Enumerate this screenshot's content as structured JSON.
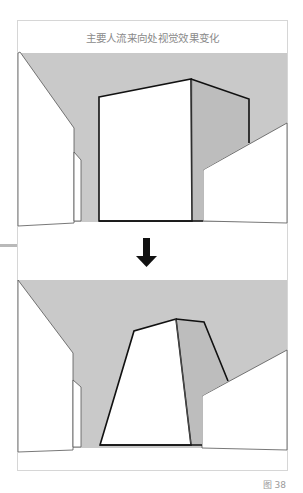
{
  "figure": {
    "title": "主要人流来向处视觉效果变化",
    "caption": "图 38",
    "colors": {
      "ceiling_gray": "#c9c9c9",
      "side_face_gray": "#bdbdbd",
      "outline": "#111111",
      "thin_line": "#555555",
      "frame_border": "#d6d6d6"
    },
    "panels": [
      {
        "name": "before",
        "description": "Box volume viewed from main pedestrian approach (original)"
      },
      {
        "name": "after",
        "description": "Tapered volume viewed from main pedestrian approach (modified)"
      }
    ],
    "arrow": {
      "direction": "down",
      "icon": "down-arrow-icon"
    }
  }
}
